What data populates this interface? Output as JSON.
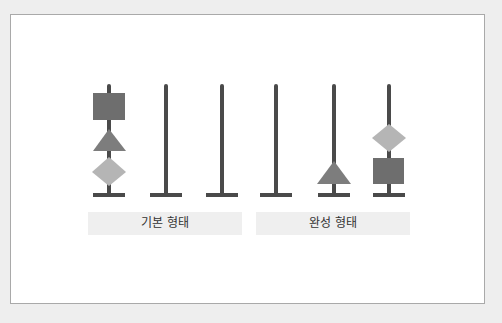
{
  "diagram": {
    "title": "",
    "colors": {
      "background": "#eeeeee",
      "frame": "#ffffff",
      "frame_border": "#a9a9a9",
      "pole": "#4a4a4a",
      "square": "#6e6e6e",
      "triangle": "#7d7d7d",
      "diamond": "#b5b5b5",
      "label_bg": "#efefef",
      "label_text": "#333333"
    },
    "groups": [
      {
        "label": "기본 형태",
        "poles": [
          {
            "index": 1,
            "pieces_top_to_bottom": [
              "square",
              "triangle",
              "diamond"
            ]
          },
          {
            "index": 2,
            "pieces_top_to_bottom": []
          },
          {
            "index": 3,
            "pieces_top_to_bottom": []
          }
        ]
      },
      {
        "label": "완성 형태",
        "poles": [
          {
            "index": 1,
            "pieces_top_to_bottom": []
          },
          {
            "index": 2,
            "pieces_top_to_bottom": [
              "triangle"
            ]
          },
          {
            "index": 3,
            "pieces_top_to_bottom": [
              "diamond",
              "square"
            ]
          }
        ]
      }
    ]
  }
}
